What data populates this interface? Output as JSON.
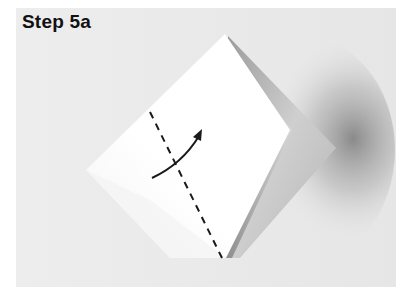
{
  "step": {
    "title": "Step 5a"
  },
  "illustration": {
    "subject": "origami-model-folded-paper",
    "fold_line": "valley-fold-dashed-line",
    "arrow": "fold-direction-arrow",
    "colors": {
      "background": "#ebebeb",
      "paper": "#ffffff",
      "ink": "#1a1a1a",
      "shadow": "#6e6e6e"
    }
  }
}
